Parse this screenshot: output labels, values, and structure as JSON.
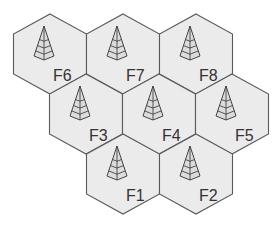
{
  "diagram": {
    "type": "hexagonal-cell-layout",
    "colors": {
      "cell_fill": "#ebebeb",
      "cell_stroke": "#5a5a5a",
      "icon_stroke": "#444444",
      "label": "#333333"
    },
    "cells": [
      {
        "id": "F6",
        "label": "F6",
        "icon": "antenna-tower-icon",
        "cx": 50,
        "cy": 54
      },
      {
        "id": "F7",
        "label": "F7",
        "icon": "antenna-tower-icon",
        "cx": 123,
        "cy": 54
      },
      {
        "id": "F8",
        "label": "F8",
        "icon": "antenna-tower-icon",
        "cx": 196,
        "cy": 54
      },
      {
        "id": "F3",
        "label": "F3",
        "icon": "antenna-tower-icon",
        "cx": 86,
        "cy": 114
      },
      {
        "id": "F4",
        "label": "F4",
        "icon": "antenna-tower-icon",
        "cx": 159,
        "cy": 114
      },
      {
        "id": "F5",
        "label": "F5",
        "icon": "antenna-tower-icon",
        "cx": 232,
        "cy": 114
      },
      {
        "id": "F1",
        "label": "F1",
        "icon": "antenna-tower-icon",
        "cx": 123,
        "cy": 174
      },
      {
        "id": "F2",
        "label": "F2",
        "icon": "antenna-tower-icon",
        "cx": 196,
        "cy": 174
      }
    ]
  }
}
